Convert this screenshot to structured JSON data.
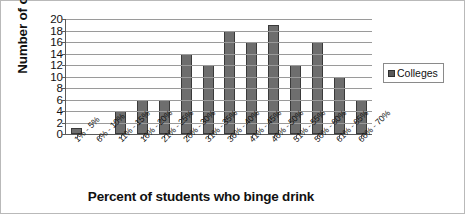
{
  "chart_data": {
    "type": "bar",
    "title": "",
    "xlabel": "Percent of students who binge drink",
    "ylabel": "Number of colleges",
    "categories": [
      "1% - 5%",
      "6% - 10%",
      "11% - 15%",
      "16% - 20%",
      "21% - 25%",
      "26% - 30%",
      "31% - 35%",
      "36% - 40%",
      "41% - 45%",
      "46% - 50%",
      "51% - 55%",
      "56% - 60%",
      "61% - 65%",
      "66% - 70%"
    ],
    "values": [
      1,
      0,
      4,
      6,
      6,
      14,
      12,
      18,
      16,
      19,
      12,
      16,
      10,
      6
    ],
    "series": [
      {
        "name": "Colleges",
        "values": [
          1,
          0,
          4,
          6,
          6,
          14,
          12,
          18,
          16,
          19,
          12,
          16,
          10,
          6
        ]
      }
    ],
    "ylim": [
      0,
      20
    ],
    "ytick_step": 2,
    "yticks": [
      "20",
      "18",
      "16",
      "14",
      "12",
      "10",
      "8",
      "6",
      "4",
      "2",
      "0"
    ],
    "grid": true,
    "legend": {
      "position": "right",
      "entries": [
        {
          "label": "Colleges",
          "color": "#595959"
        }
      ]
    },
    "bar_color": "#6e6e6e",
    "bar_edge_color": "#3a3a3a",
    "axis_color": "#5a5a5a",
    "gridline_color": "#9a9a9a",
    "background": "#ffffff"
  }
}
